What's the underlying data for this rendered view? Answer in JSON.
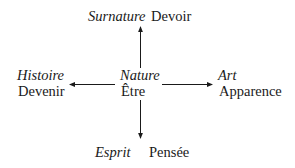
{
  "diagram": {
    "center": {
      "italic": "Nature",
      "plain": "Être"
    },
    "top": {
      "italic": "Surnature",
      "plain": "Devoir"
    },
    "left": {
      "italic": "Histoire",
      "plain": "Devenir"
    },
    "right": {
      "italic": "Art",
      "plain": "Apparence"
    },
    "bottom": {
      "italic": "Esprit",
      "plain": "Pensée"
    },
    "edges": [
      {
        "from": "center",
        "to": "top"
      },
      {
        "from": "center",
        "to": "left"
      },
      {
        "from": "center",
        "to": "right"
      },
      {
        "from": "center",
        "to": "bottom"
      }
    ],
    "line_color": "#1a1a1a"
  }
}
